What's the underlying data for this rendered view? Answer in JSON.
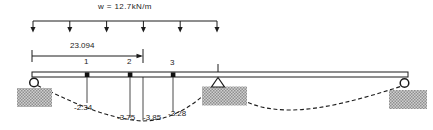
{
  "beam": {
    "load_label": "w = 12.7kN/m",
    "dimension_label": "23.094",
    "node_labels": [
      "1",
      "2",
      "3"
    ],
    "moment_labels": [
      "-2.34",
      "-3.75",
      "-3.85",
      "-3.28"
    ],
    "colors": {
      "line": "#1c1c1c",
      "background": "#ffffff",
      "foundation_block": "#b5b5b5"
    }
  }
}
